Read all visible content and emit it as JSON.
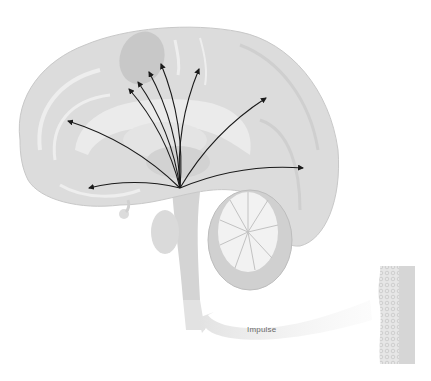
{
  "diagram": {
    "labels": {
      "impulse": "Impulse"
    },
    "colors": {
      "background": "#ffffff",
      "cortex": "#dcdcdc",
      "cortex_shade": "#cacaca",
      "inner": "#e8e8e8",
      "deep": "#c4c4c4",
      "cerebellum_white": "#f2f2f2",
      "arrow": "#1a1a1a",
      "impulse_arrow": "#e4e4e4",
      "tissue": "#d6d6d6"
    },
    "origin": [
      180,
      188
    ],
    "arrows": [
      {
        "name": "arrow-up-1",
        "end": [
          129,
          89
        ]
      },
      {
        "name": "arrow-up-2",
        "end": [
          138,
          82
        ]
      },
      {
        "name": "arrow-up-3",
        "end": [
          149,
          72
        ]
      },
      {
        "name": "arrow-up-4",
        "end": [
          161,
          64
        ]
      },
      {
        "name": "arrow-up-5",
        "end": [
          199,
          69
        ]
      },
      {
        "name": "arrow-right-upper",
        "end": [
          266,
          98
        ]
      },
      {
        "name": "arrow-right-lower",
        "end": [
          303,
          168
        ]
      },
      {
        "name": "arrow-left-upper",
        "end": [
          68,
          121
        ]
      },
      {
        "name": "arrow-left-lower",
        "end": [
          89,
          188
        ]
      }
    ]
  }
}
